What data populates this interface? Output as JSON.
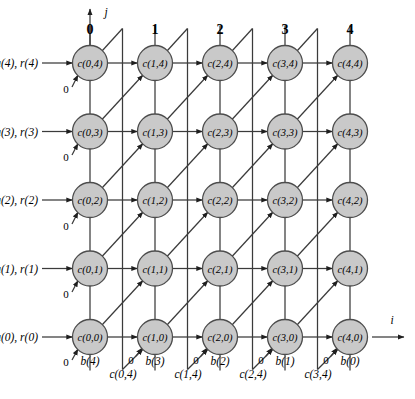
{
  "figure": {
    "node_fill": "#c9c9c9",
    "node_stroke": "#4d4d4d",
    "line_color": "#3b3b3b"
  },
  "axes": {
    "vertical_label": "j",
    "horizontal_label": "i"
  },
  "columns": [
    {
      "header": "0",
      "x": 90
    },
    {
      "header": "1",
      "x": 155
    },
    {
      "header": "2",
      "x": 220
    },
    {
      "header": "3",
      "x": 285
    },
    {
      "header": "4",
      "x": 350
    }
  ],
  "rows": [
    {
      "label": "a(4), r(4)",
      "j": 4,
      "y": 63
    },
    {
      "label": "a(3), r(3)",
      "j": 3,
      "y": 131.5
    },
    {
      "label": "a(2), r(2)",
      "j": 2,
      "y": 200
    },
    {
      "label": "a(1), r(1)",
      "j": 1,
      "y": 268.5
    },
    {
      "label": "a(0), r(0)",
      "j": 0,
      "y": 337
    }
  ],
  "nodes": [
    {
      "label": "c(0,4)",
      "i": 0,
      "j": 4,
      "x": 90,
      "y": 63
    },
    {
      "label": "c(1,4)",
      "i": 1,
      "j": 4,
      "x": 155,
      "y": 63
    },
    {
      "label": "c(2,4)",
      "i": 2,
      "j": 4,
      "x": 220,
      "y": 63
    },
    {
      "label": "c(3,4)",
      "i": 3,
      "j": 4,
      "x": 285,
      "y": 63
    },
    {
      "label": "c(4,4)",
      "i": 4,
      "j": 4,
      "x": 350,
      "y": 63
    },
    {
      "label": "c(0,3)",
      "i": 0,
      "j": 3,
      "x": 90,
      "y": 131.5
    },
    {
      "label": "c(1,3)",
      "i": 1,
      "j": 3,
      "x": 155,
      "y": 131.5
    },
    {
      "label": "c(2,3)",
      "i": 2,
      "j": 3,
      "x": 220,
      "y": 131.5
    },
    {
      "label": "c(3,3)",
      "i": 3,
      "j": 3,
      "x": 285,
      "y": 131.5
    },
    {
      "label": "c(4,3)",
      "i": 4,
      "j": 3,
      "x": 350,
      "y": 131.5
    },
    {
      "label": "c(0,2)",
      "i": 0,
      "j": 2,
      "x": 90,
      "y": 200
    },
    {
      "label": "c(1,2)",
      "i": 1,
      "j": 2,
      "x": 155,
      "y": 200
    },
    {
      "label": "c(2,2)",
      "i": 2,
      "j": 2,
      "x": 220,
      "y": 200
    },
    {
      "label": "c(3,2)",
      "i": 3,
      "j": 2,
      "x": 285,
      "y": 200
    },
    {
      "label": "c(4,2)",
      "i": 4,
      "j": 2,
      "x": 350,
      "y": 200
    },
    {
      "label": "c(0,1)",
      "i": 0,
      "j": 1,
      "x": 90,
      "y": 268.5
    },
    {
      "label": "c(1,1)",
      "i": 1,
      "j": 1,
      "x": 155,
      "y": 268.5
    },
    {
      "label": "c(2,1)",
      "i": 2,
      "j": 1,
      "x": 220,
      "y": 268.5
    },
    {
      "label": "c(3,1)",
      "i": 3,
      "j": 1,
      "x": 285,
      "y": 268.5
    },
    {
      "label": "c(4,1)",
      "i": 4,
      "j": 1,
      "x": 350,
      "y": 268.5
    },
    {
      "label": "c(0,0)",
      "i": 0,
      "j": 0,
      "x": 90,
      "y": 337
    },
    {
      "label": "c(1,0)",
      "i": 1,
      "j": 0,
      "x": 155,
      "y": 337
    },
    {
      "label": "c(2,0)",
      "i": 2,
      "j": 0,
      "x": 220,
      "y": 337
    },
    {
      "label": "c(3,0)",
      "i": 3,
      "j": 0,
      "x": 285,
      "y": 337
    },
    {
      "label": "c(4,0)",
      "i": 4,
      "j": 0,
      "x": 350,
      "y": 337
    }
  ],
  "zero_inputs_left": [
    {
      "label": "0",
      "x": 66,
      "y": 89
    },
    {
      "label": "0",
      "x": 66,
      "y": 157
    },
    {
      "label": "0",
      "x": 66,
      "y": 226
    },
    {
      "label": "0",
      "x": 66,
      "y": 294
    },
    {
      "label": "0",
      "x": 66,
      "y": 362
    }
  ],
  "zero_inputs_bottom": [
    {
      "label": "0",
      "x": 131,
      "y": 360
    },
    {
      "label": "0",
      "x": 196,
      "y": 360
    },
    {
      "label": "0",
      "x": 261,
      "y": 360
    },
    {
      "label": "0",
      "x": 326,
      "y": 360
    }
  ],
  "b_labels": [
    {
      "label": "b(4)",
      "x": 90,
      "y": 361
    },
    {
      "label": "b(3)",
      "x": 155,
      "y": 361
    },
    {
      "label": "b(2)",
      "x": 220,
      "y": 361
    },
    {
      "label": "b(1)",
      "x": 285,
      "y": 361
    },
    {
      "label": "b(0)",
      "x": 350,
      "y": 361
    }
  ],
  "c_feedback_labels": [
    {
      "label": "c(0,4)",
      "x": 123,
      "y": 374
    },
    {
      "label": "c(1,4)",
      "x": 188,
      "y": 374
    },
    {
      "label": "c(2,4)",
      "x": 253,
      "y": 374
    },
    {
      "label": "c(3,4)",
      "x": 318,
      "y": 374
    }
  ]
}
